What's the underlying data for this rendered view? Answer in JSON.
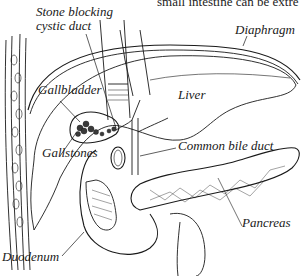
{
  "figure": {
    "caption_fragment": "small intestine can be extre",
    "labels": {
      "stone_blocking_line1": "Stone blocking",
      "stone_blocking_line2": "cystic duct",
      "diaphragm": "Diaphragm",
      "gallbladder": "Gallbladder",
      "liver": "Liver",
      "common_bile_duct": "Common bile duct",
      "gallstones": "Gallstones",
      "pancreas": "Pancreas",
      "duodenum": "Duodenum"
    },
    "colors": {
      "ink": "#1a1a1a",
      "background": "#ffffff",
      "stones": "#3a3a3a"
    }
  }
}
